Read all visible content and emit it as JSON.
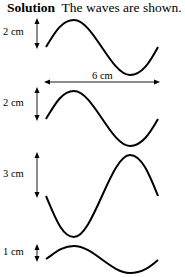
{
  "heading": {
    "bold": "Solution",
    "text": "The waves are shown."
  },
  "waves": [
    {
      "amplitude_label": "2 cm",
      "wavelength_label": "6 cm",
      "shape": "sine, starts at midline going up"
    },
    {
      "amplitude_label": "2 cm",
      "shape": "sine, starts at midline going up"
    },
    {
      "amplitude_label": "3 cm",
      "shape": "inverted sine, starts at midline going down"
    },
    {
      "amplitude_label": "1 cm",
      "shape": "sine, starts at midline going up"
    }
  ]
}
